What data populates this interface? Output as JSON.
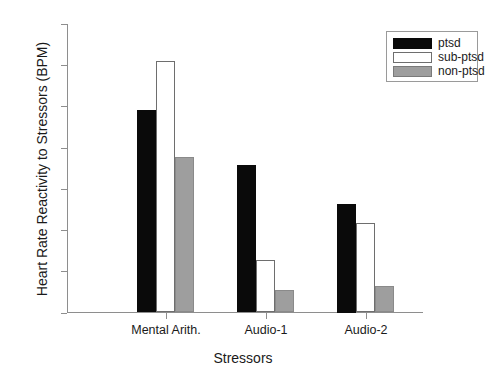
{
  "chart_data": {
    "type": "bar",
    "title": "",
    "xlabel": "Stressors",
    "ylabel": "Heart Rate Reactivity to Stressors (BPM)",
    "categories": [
      "Mental Arith.",
      "Audio-1",
      "Audio-2"
    ],
    "series": [
      {
        "name": "ptsd",
        "color": "#0a0a0a",
        "values": [
          9.85,
          7.15,
          5.25
        ]
      },
      {
        "name": "sub-ptsd",
        "color": "#ffffff",
        "values": [
          12.2,
          2.55,
          4.35
        ]
      },
      {
        "name": "non-ptsd",
        "color": "#9e9e9e",
        "values": [
          7.55,
          1.1,
          1.3
        ]
      }
    ],
    "ylim": [
      0,
      14
    ],
    "ytick_labels": [
      "14",
      "12",
      "10",
      "8",
      "6",
      "4",
      "2",
      "0"
    ],
    "ytick_values": [
      14,
      12,
      10,
      8,
      6,
      4,
      2,
      0
    ],
    "grid": false,
    "legend_position": "top-right",
    "legend_entries": [
      "ptsd",
      "sub-ptsd",
      "non-ptsd"
    ]
  },
  "axes": {
    "y_title": "Heart Rate Reactivity to Stressors (BPM)",
    "x_title": "Stressors"
  },
  "legend": {
    "entries": [
      {
        "label": "ptsd"
      },
      {
        "label": "sub-ptsd"
      },
      {
        "label": "non-ptsd"
      }
    ]
  }
}
